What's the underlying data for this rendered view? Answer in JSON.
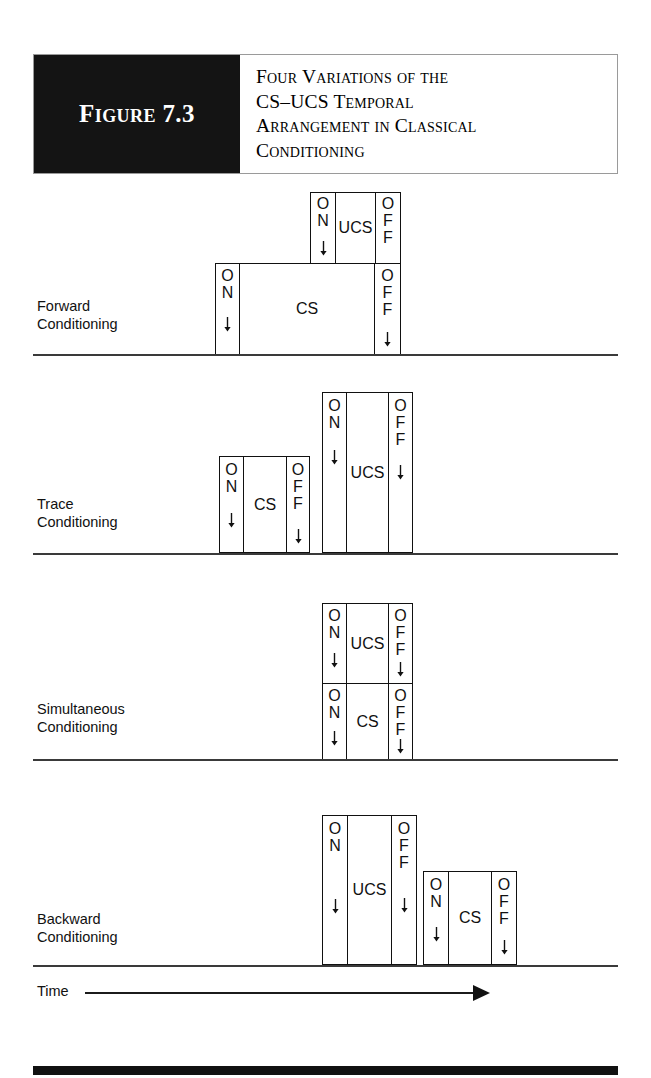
{
  "figure": {
    "badge": "Figure 7.3",
    "title_lines": [
      "Four Variations of the",
      "CS–UCS Temporal",
      "Arrangement in Classical",
      "Conditioning"
    ],
    "time_axis": {
      "label": "Time",
      "arrow_icon": "right-arrow-icon"
    },
    "labels": {
      "on": "ON",
      "off": "OFF",
      "cs": "CS",
      "ucs": "UCS"
    }
  },
  "panels": [
    {
      "id": "forward",
      "name": "forward-conditioning",
      "label_lines": [
        "Forward",
        "Conditioning"
      ],
      "boxes": [
        {
          "stimulus": "UCS",
          "on": "ON",
          "off": "OFF",
          "role": "ucs-box"
        },
        {
          "stimulus": "CS",
          "on": "ON",
          "off": "OFF",
          "role": "cs-box"
        }
      ]
    },
    {
      "id": "trace",
      "name": "trace-conditioning",
      "label_lines": [
        "Trace",
        "Conditioning"
      ],
      "boxes": [
        {
          "stimulus": "CS",
          "on": "ON",
          "off": "OFF",
          "role": "cs-box"
        },
        {
          "stimulus": "UCS",
          "on": "ON",
          "off": "OFF",
          "role": "ucs-box"
        }
      ]
    },
    {
      "id": "simultaneous",
      "name": "simultaneous-conditioning",
      "label_lines": [
        "Simultaneous",
        "Conditioning"
      ],
      "boxes": [
        {
          "stimulus": "UCS",
          "on": "ON",
          "off": "OFF",
          "role": "ucs-box"
        },
        {
          "stimulus": "CS",
          "on": "ON",
          "off": "OFF",
          "role": "cs-box"
        }
      ]
    },
    {
      "id": "backward",
      "name": "backward-conditioning",
      "label_lines": [
        "Backward",
        "Conditioning"
      ],
      "boxes": [
        {
          "stimulus": "UCS",
          "on": "ON",
          "off": "OFF",
          "role": "ucs-box"
        },
        {
          "stimulus": "CS",
          "on": "ON",
          "off": "OFF",
          "role": "cs-box"
        }
      ]
    }
  ],
  "chart_data": {
    "type": "table",
    "title": "Four Variations of the CS–UCS Temporal Arrangement in Classical Conditioning",
    "xlabel": "Time",
    "ylabel": "",
    "grid": false,
    "note": "Timeline diagram: each panel shows CS and UCS intervals as ON/OFF bracketed boxes along a time baseline.",
    "rows": [
      {
        "arrangement": "Forward Conditioning",
        "cs_start": 0.31,
        "cs_end": 0.63,
        "ucs_start": 0.49,
        "ucs_end": 0.63,
        "description": "CS begins first and stays on; UCS starts later and both end together."
      },
      {
        "arrangement": "Trace Conditioning",
        "cs_start": 0.32,
        "cs_end": 0.47,
        "ucs_start": 0.49,
        "ucs_end": 0.65,
        "description": "CS turns on and off before the UCS begins, leaving a gap."
      },
      {
        "arrangement": "Simultaneous Conditioning",
        "cs_start": 0.49,
        "cs_end": 0.65,
        "ucs_start": 0.49,
        "ucs_end": 0.65,
        "description": "CS and UCS begin and end at exactly the same time."
      },
      {
        "arrangement": "Backward Conditioning",
        "cs_start": 0.66,
        "cs_end": 0.83,
        "ucs_start": 0.49,
        "ucs_end": 0.65,
        "description": "UCS occurs first; CS follows after the UCS ends."
      }
    ]
  },
  "colors": {
    "ink": "#111111",
    "badge_bg": "#141414",
    "badge_text": "#ffffff",
    "rule": "#9a9a9a"
  }
}
